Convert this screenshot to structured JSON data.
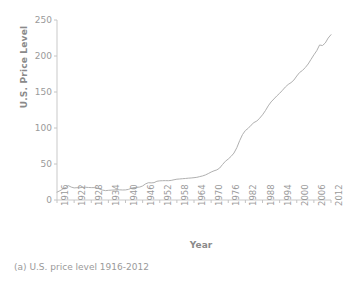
{
  "chart_data": {
    "type": "line",
    "title": "",
    "xlabel": "Year",
    "ylabel": "U.S. Price Level",
    "xlim": [
      1916,
      2012
    ],
    "ylim": [
      0,
      250
    ],
    "yticks": [
      0,
      50,
      100,
      150,
      200,
      250
    ],
    "xticks": [
      1916,
      1922,
      1928,
      1934,
      1940,
      1946,
      1952,
      1958,
      1964,
      1970,
      1976,
      1982,
      1988,
      1994,
      2000,
      2006,
      2012
    ],
    "grid": false,
    "legend": null,
    "line_color": "#b0b0b0",
    "series": [
      {
        "name": "U.S. Price Level",
        "x": [
          1916,
          1917,
          1918,
          1919,
          1920,
          1921,
          1922,
          1923,
          1924,
          1925,
          1926,
          1927,
          1928,
          1929,
          1930,
          1931,
          1932,
          1933,
          1934,
          1935,
          1936,
          1937,
          1938,
          1939,
          1940,
          1941,
          1942,
          1943,
          1944,
          1945,
          1946,
          1947,
          1948,
          1949,
          1950,
          1951,
          1952,
          1953,
          1954,
          1955,
          1956,
          1957,
          1958,
          1959,
          1960,
          1961,
          1962,
          1963,
          1964,
          1965,
          1966,
          1967,
          1968,
          1969,
          1970,
          1971,
          1972,
          1973,
          1974,
          1975,
          1976,
          1977,
          1978,
          1979,
          1980,
          1981,
          1982,
          1983,
          1984,
          1985,
          1986,
          1987,
          1988,
          1989,
          1990,
          1991,
          1992,
          1993,
          1994,
          1995,
          1996,
          1997,
          1998,
          1999,
          2000,
          2001,
          2002,
          2003,
          2004,
          2005,
          2006,
          2007,
          2008,
          2009,
          2010,
          2011,
          2012
        ],
        "y": [
          10.9,
          12.8,
          15.1,
          17.3,
          20.0,
          17.9,
          16.8,
          17.1,
          17.1,
          17.5,
          17.7,
          17.4,
          17.2,
          17.2,
          16.7,
          15.2,
          13.7,
          13.0,
          13.4,
          13.7,
          13.9,
          14.4,
          14.1,
          13.9,
          14.0,
          14.7,
          16.3,
          17.3,
          17.6,
          18.0,
          19.5,
          22.3,
          24.0,
          23.8,
          24.1,
          26.0,
          26.6,
          26.8,
          26.9,
          26.8,
          27.2,
          28.1,
          28.9,
          29.2,
          29.6,
          29.9,
          30.3,
          30.6,
          31.0,
          31.5,
          32.5,
          33.4,
          34.8,
          36.7,
          38.8,
          40.5,
          41.8,
          44.4,
          49.3,
          53.8,
          56.9,
          60.6,
          65.2,
          72.6,
          82.4,
          90.9,
          96.5,
          99.6,
          103.9,
          107.6,
          109.6,
          113.6,
          118.3,
          124.0,
          130.7,
          136.2,
          140.3,
          144.5,
          148.2,
          152.4,
          156.9,
          160.5,
          163.0,
          166.6,
          172.2,
          177.1,
          179.9,
          184.0,
          188.9,
          195.3,
          201.6,
          207.3,
          215.3,
          214.5,
          218.1,
          224.9,
          229.6
        ]
      }
    ]
  },
  "axes": {
    "ylabel": "U.S. Price Level",
    "xlabel": "Year",
    "ytick_labels": [
      "250",
      "200",
      "150",
      "100",
      "50",
      "0"
    ],
    "xtick_labels": [
      "1916",
      "1922",
      "1928",
      "1934",
      "1940",
      "1946",
      "1952",
      "1958",
      "1964",
      "1970",
      "1976",
      "1982",
      "1988",
      "1994",
      "2000",
      "2006",
      "2012"
    ]
  },
  "caption": {
    "text": "(a) U.S. price level 1916-2012"
  },
  "colors": {
    "line": "#b0b0b0",
    "axis": "#c4c4c4",
    "text": "#9a9a9a",
    "background": "#ffffff"
  }
}
